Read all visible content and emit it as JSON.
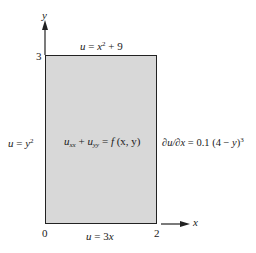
{
  "axes": {
    "x_label": "x",
    "y_label": "y",
    "origin_label": "0",
    "x_tick": "2",
    "y_tick": "3"
  },
  "boundary_conditions": {
    "top": {
      "lhs": "u",
      "eq": " = ",
      "base": "x",
      "exp": "2",
      "rest": " + 9"
    },
    "left": {
      "lhs": "u",
      "eq": " = ",
      "base": "y",
      "exp": "2"
    },
    "bottom": {
      "lhs": "u",
      "eq": " = ",
      "rest": "3",
      "var": "x"
    },
    "right": {
      "prefix": "∂u/∂x",
      "eq": " = 0.1 (4 − ",
      "var": "y",
      "close": ")",
      "exp": "3"
    }
  },
  "equation": {
    "u1": "u",
    "sub1": "xx",
    "plus": " + ",
    "u2": "u",
    "sub2": "yy",
    "eq": " = ",
    "f": "f",
    "args": " (x, y)"
  },
  "colors": {
    "fill": "#d8d8d8",
    "stroke": "#222222"
  }
}
